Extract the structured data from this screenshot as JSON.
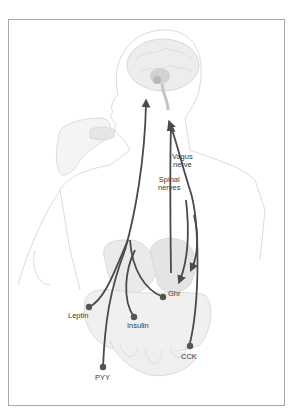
{
  "diagram": {
    "labels": {
      "vagus_nerve_line1": "Vagus",
      "vagus_nerve_line2": "nerve",
      "spinal_nerves_line1": "Spinal",
      "spinal_nerves_line2": "nerves",
      "ghr": "Ghr",
      "leptin": "Leptin",
      "insulin": "Insulin",
      "pyy": "PYY",
      "cck": "CCK"
    },
    "colors": {
      "pathway": "#4a4a4a",
      "node": "#555555",
      "body_outline": "#d8d8d8",
      "organ_fill": "#ececec",
      "frame": "#a8a8a8"
    }
  }
}
